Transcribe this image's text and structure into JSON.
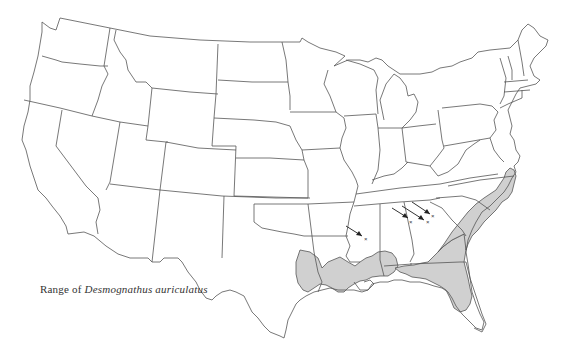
{
  "figure": {
    "type": "range-map",
    "region": "Contiguous United States",
    "caption": {
      "prefix": "Range of",
      "species": "Desmognathus auriculatus"
    },
    "colors": {
      "background": "#ffffff",
      "outline": "#555555",
      "range_fill": "#d0d0d0",
      "arrow": "#333333"
    },
    "range_regions": [
      {
        "name": "east-texas-louisiana-mississippi-coastal-plain"
      },
      {
        "name": "florida-panhandle-georgia-coastal-plain"
      },
      {
        "name": "atlantic-coastal-plain-sc-nc-va"
      }
    ],
    "disjunct_localities": [
      {
        "name": "mississippi-locality",
        "marker": "×"
      },
      {
        "name": "alabama-locality",
        "marker": "×"
      },
      {
        "name": "georgia-locality-1",
        "marker": "×"
      },
      {
        "name": "georgia-locality-2",
        "marker": "×"
      }
    ]
  }
}
